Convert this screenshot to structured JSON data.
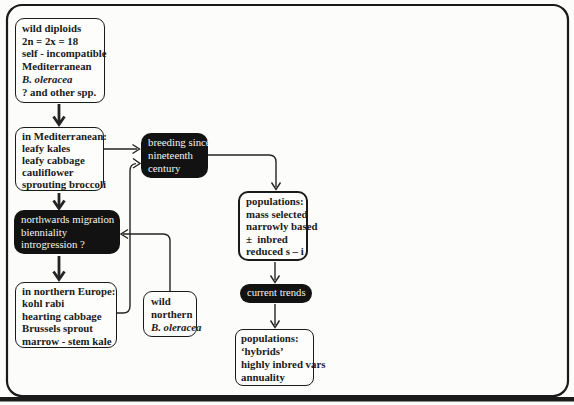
{
  "figure": {
    "type": "flowchart",
    "topic": "domestication and breeding history of Brassica oleracea"
  },
  "colors": {
    "ink": "#1a1a1a",
    "connector": "#242424",
    "box_fill_dark": "#121212",
    "text_on_dark": "#f5f4ef",
    "background": "#fcfcfa"
  },
  "boxes": {
    "wild_diploids": {
      "lines": [
        "wild diploids",
        "2n = 2x = 18",
        "self - incompatible",
        "Mediterranean",
        "B. oleracea",
        "? and other spp."
      ]
    },
    "in_mediterranean": {
      "lines": [
        "in Mediterranean:",
        "leafy kales",
        "leafy cabbage",
        "cauliflower",
        "sprouting broccoli"
      ]
    },
    "breeding_since": {
      "lines": [
        "breeding since",
        "nineteenth",
        "century"
      ]
    },
    "northwards": {
      "lines": [
        "northwards migration",
        "bienniality",
        "introgression ?"
      ]
    },
    "northern_europe": {
      "lines": [
        "in northern Europe:",
        "kohl rabi",
        "hearting cabbage",
        "Brussels sprout",
        "marrow - stem kale"
      ]
    },
    "wild_northern": {
      "lines": [
        "wild",
        "northern",
        "B. oleracea"
      ]
    },
    "populations_mass": {
      "lines": [
        "populations:",
        "mass selected",
        "narrowly based",
        "±  inbred",
        "reduced s – i"
      ]
    },
    "current_trends": {
      "label": "current trends"
    },
    "populations_hybrids": {
      "lines": [
        "populations:",
        "‘hybrids’",
        "highly inbred vars",
        "annuality"
      ]
    }
  },
  "edges": [
    {
      "from": "wild_diploids",
      "to": "in_mediterranean",
      "style": "bold"
    },
    {
      "from": "in_mediterranean",
      "to": "breeding_since",
      "style": "thin"
    },
    {
      "from": "in_mediterranean",
      "to": "northwards",
      "style": "bold"
    },
    {
      "from": "northwards",
      "to": "northern_europe",
      "style": "bold"
    },
    {
      "from": "northern_europe",
      "to": "breeding_since",
      "style": "thin"
    },
    {
      "from": "wild_northern",
      "to": "northwards",
      "style": "thin"
    },
    {
      "from": "breeding_since",
      "to": "populations_mass",
      "style": "thin"
    },
    {
      "from": "populations_mass",
      "to": "current_trends",
      "style": "thin"
    },
    {
      "from": "current_trends",
      "to": "populations_hybrids",
      "style": "thin"
    }
  ]
}
